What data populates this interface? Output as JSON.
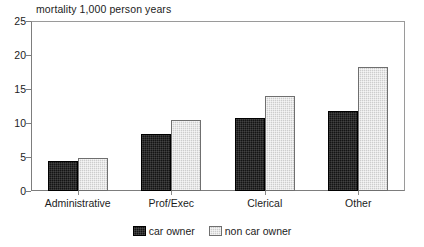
{
  "chart_data": {
    "type": "bar",
    "title": "mortality 1,000 person years",
    "xlabel": "",
    "ylabel": "",
    "ylim": [
      0,
      25
    ],
    "yticks": [
      0,
      5,
      10,
      15,
      20,
      25
    ],
    "ytick_labels": [
      "0",
      "5",
      "10",
      "15",
      "20",
      "25"
    ],
    "grid": false,
    "legend_position": "bottom-center",
    "categories": [
      "Administrative",
      "Prof/Exec",
      "Clerical",
      "Other"
    ],
    "series": [
      {
        "name": "car owner",
        "color": "#141414",
        "values": [
          4.4,
          8.4,
          10.7,
          11.7
        ]
      },
      {
        "name": "non car owner",
        "color": "#cdcdcd",
        "values": [
          4.9,
          10.5,
          14.0,
          18.3
        ]
      }
    ]
  },
  "legend": {
    "items": [
      {
        "label": "car owner",
        "series": 0
      },
      {
        "label": "non car owner",
        "series": 1
      }
    ]
  }
}
